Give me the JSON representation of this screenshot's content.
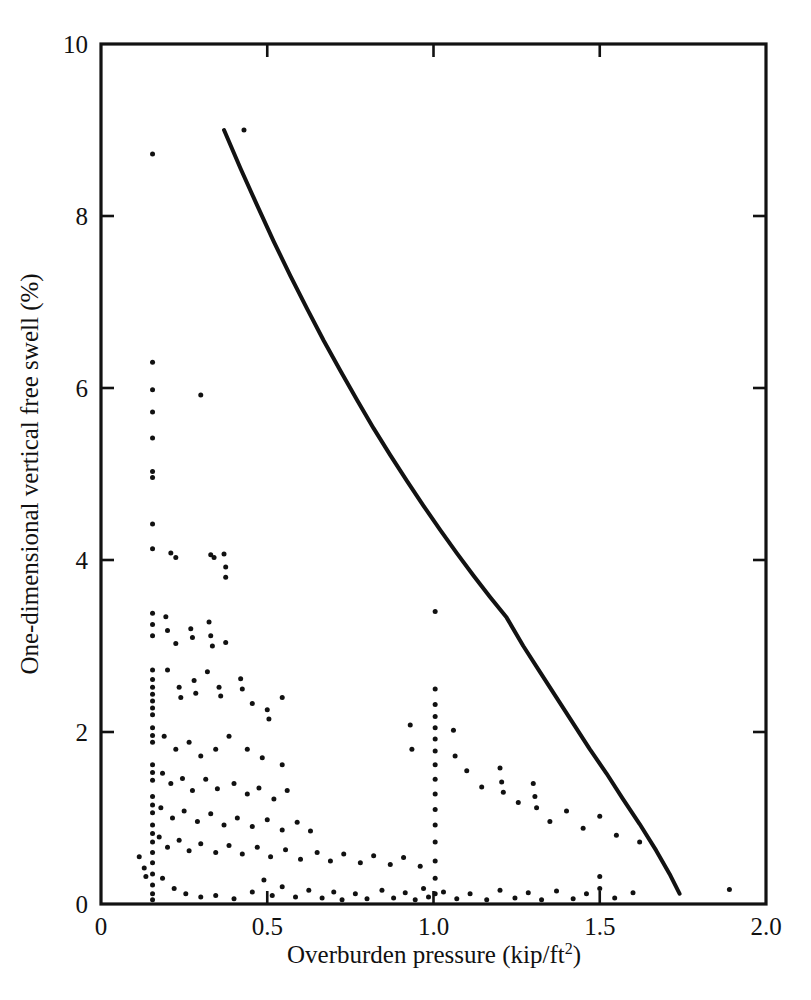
{
  "chart_data": {
    "type": "scatter",
    "title": "",
    "subtitle": "",
    "xlabel": "Overburden pressure (kip/ft",
    "xlabel_sup": "2",
    "xlabel_tail": ")",
    "xlabel_full": "Overburden pressure (kip/ft2)",
    "ylabel": "One-dimensional vertical free swell (%)",
    "xlim": [
      0,
      2.0
    ],
    "ylim": [
      0,
      10
    ],
    "xticks": [
      0,
      0.5,
      1.0,
      1.5,
      2.0
    ],
    "xtick_labels": [
      "0",
      "0.5",
      "1.0",
      "1.5",
      "2.0"
    ],
    "yticks": [
      0,
      2,
      4,
      6,
      8,
      10
    ],
    "ytick_labels": [
      "0",
      "2",
      "4",
      "6",
      "8",
      "10"
    ],
    "grid": false,
    "legend": null,
    "legend_position": "none",
    "frame": "box",
    "tick_direction": "in",
    "marker": "dot",
    "marker_color": "#111111",
    "curve_color": "#121212",
    "series": [
      {
        "name": "Upper-bound envelope curve",
        "type": "line",
        "points": [
          [
            0.37,
            9.0
          ],
          [
            0.42,
            8.55
          ],
          [
            0.47,
            8.12
          ],
          [
            0.52,
            7.7
          ],
          [
            0.57,
            7.3
          ],
          [
            0.62,
            6.92
          ],
          [
            0.67,
            6.55
          ],
          [
            0.72,
            6.2
          ],
          [
            0.77,
            5.86
          ],
          [
            0.82,
            5.53
          ],
          [
            0.87,
            5.22
          ],
          [
            0.92,
            4.92
          ],
          [
            0.97,
            4.63
          ],
          [
            1.02,
            4.35
          ],
          [
            1.07,
            4.08
          ],
          [
            1.12,
            3.82
          ],
          [
            1.17,
            3.57
          ],
          [
            1.22,
            3.33
          ],
          [
            1.27,
            3.0
          ],
          [
            1.32,
            2.7
          ],
          [
            1.37,
            2.4
          ],
          [
            1.42,
            2.1
          ],
          [
            1.47,
            1.8
          ],
          [
            1.52,
            1.52
          ],
          [
            1.57,
            1.22
          ],
          [
            1.62,
            0.93
          ],
          [
            1.67,
            0.62
          ],
          [
            1.71,
            0.35
          ],
          [
            1.74,
            0.12
          ]
        ]
      },
      {
        "name": "Measured free swell data",
        "type": "scatter",
        "points": [
          [
            0.155,
            8.72
          ],
          [
            0.43,
            9.0
          ],
          [
            0.155,
            6.3
          ],
          [
            0.155,
            5.98
          ],
          [
            0.155,
            5.72
          ],
          [
            0.155,
            5.42
          ],
          [
            0.155,
            5.03
          ],
          [
            0.155,
            4.96
          ],
          [
            0.3,
            5.92
          ],
          [
            0.155,
            4.42
          ],
          [
            0.155,
            4.13
          ],
          [
            0.21,
            4.08
          ],
          [
            0.225,
            4.03
          ],
          [
            0.33,
            4.06
          ],
          [
            0.34,
            4.03
          ],
          [
            0.37,
            4.07
          ],
          [
            0.375,
            3.92
          ],
          [
            0.375,
            3.8
          ],
          [
            0.155,
            3.38
          ],
          [
            0.155,
            3.25
          ],
          [
            0.155,
            3.12
          ],
          [
            0.195,
            3.34
          ],
          [
            0.2,
            3.18
          ],
          [
            0.225,
            3.03
          ],
          [
            0.27,
            3.2
          ],
          [
            0.275,
            3.1
          ],
          [
            0.325,
            3.28
          ],
          [
            0.33,
            3.12
          ],
          [
            0.335,
            3.0
          ],
          [
            0.375,
            3.04
          ],
          [
            1.005,
            3.4
          ],
          [
            0.155,
            2.72
          ],
          [
            0.155,
            2.61
          ],
          [
            0.155,
            2.52
          ],
          [
            0.155,
            2.44
          ],
          [
            0.155,
            2.36
          ],
          [
            0.155,
            2.28
          ],
          [
            0.155,
            2.2
          ],
          [
            0.2,
            2.72
          ],
          [
            0.235,
            2.52
          ],
          [
            0.24,
            2.4
          ],
          [
            0.28,
            2.6
          ],
          [
            0.285,
            2.45
          ],
          [
            0.32,
            2.7
          ],
          [
            0.355,
            2.52
          ],
          [
            0.36,
            2.42
          ],
          [
            0.42,
            2.62
          ],
          [
            0.425,
            2.5
          ],
          [
            0.455,
            2.33
          ],
          [
            0.5,
            2.26
          ],
          [
            0.505,
            2.15
          ],
          [
            0.545,
            2.4
          ],
          [
            0.155,
            2.05
          ],
          [
            0.155,
            1.96
          ],
          [
            0.155,
            1.88
          ],
          [
            0.19,
            1.95
          ],
          [
            0.225,
            1.8
          ],
          [
            0.265,
            1.88
          ],
          [
            0.3,
            1.72
          ],
          [
            0.345,
            1.8
          ],
          [
            0.385,
            1.95
          ],
          [
            0.44,
            1.8
          ],
          [
            0.485,
            1.7
          ],
          [
            0.545,
            1.62
          ],
          [
            0.155,
            1.62
          ],
          [
            0.155,
            1.53
          ],
          [
            0.155,
            1.44
          ],
          [
            0.185,
            1.52
          ],
          [
            0.21,
            1.4
          ],
          [
            0.245,
            1.46
          ],
          [
            0.275,
            1.32
          ],
          [
            0.315,
            1.45
          ],
          [
            0.35,
            1.34
          ],
          [
            0.4,
            1.4
          ],
          [
            0.44,
            1.28
          ],
          [
            0.475,
            1.35
          ],
          [
            0.52,
            1.22
          ],
          [
            0.56,
            1.32
          ],
          [
            0.155,
            1.25
          ],
          [
            0.155,
            1.15
          ],
          [
            0.155,
            1.06
          ],
          [
            0.18,
            1.12
          ],
          [
            0.215,
            1.0
          ],
          [
            0.25,
            1.08
          ],
          [
            0.29,
            0.96
          ],
          [
            0.33,
            1.05
          ],
          [
            0.37,
            0.92
          ],
          [
            0.41,
            1.0
          ],
          [
            0.455,
            0.9
          ],
          [
            0.5,
            0.98
          ],
          [
            0.545,
            0.86
          ],
          [
            0.59,
            0.95
          ],
          [
            0.63,
            0.85
          ],
          [
            0.155,
            0.92
          ],
          [
            0.155,
            0.82
          ],
          [
            0.155,
            0.72
          ],
          [
            0.175,
            0.78
          ],
          [
            0.2,
            0.66
          ],
          [
            0.235,
            0.74
          ],
          [
            0.265,
            0.62
          ],
          [
            0.3,
            0.7
          ],
          [
            0.345,
            0.6
          ],
          [
            0.385,
            0.68
          ],
          [
            0.425,
            0.58
          ],
          [
            0.47,
            0.66
          ],
          [
            0.51,
            0.55
          ],
          [
            0.555,
            0.63
          ],
          [
            0.6,
            0.52
          ],
          [
            0.65,
            0.6
          ],
          [
            0.69,
            0.5
          ],
          [
            0.73,
            0.58
          ],
          [
            0.78,
            0.48
          ],
          [
            0.82,
            0.56
          ],
          [
            0.87,
            0.46
          ],
          [
            0.91,
            0.54
          ],
          [
            0.96,
            0.44
          ],
          [
            1.005,
            2.5
          ],
          [
            1.005,
            2.32
          ],
          [
            1.005,
            2.18
          ],
          [
            1.005,
            2.05
          ],
          [
            1.005,
            1.92
          ],
          [
            1.005,
            1.78
          ],
          [
            1.005,
            1.62
          ],
          [
            1.005,
            1.45
          ],
          [
            1.005,
            1.28
          ],
          [
            1.005,
            1.1
          ],
          [
            1.005,
            0.92
          ],
          [
            1.005,
            0.72
          ],
          [
            1.005,
            0.5
          ],
          [
            1.005,
            0.3
          ],
          [
            1.005,
            0.12
          ],
          [
            0.93,
            2.08
          ],
          [
            0.935,
            1.8
          ],
          [
            1.06,
            2.02
          ],
          [
            1.065,
            1.72
          ],
          [
            1.1,
            1.55
          ],
          [
            1.145,
            1.36
          ],
          [
            1.2,
            1.58
          ],
          [
            1.205,
            1.42
          ],
          [
            1.21,
            1.3
          ],
          [
            1.255,
            1.18
          ],
          [
            1.3,
            1.4
          ],
          [
            1.305,
            1.25
          ],
          [
            1.31,
            1.12
          ],
          [
            1.35,
            0.96
          ],
          [
            1.4,
            1.08
          ],
          [
            1.45,
            0.88
          ],
          [
            1.5,
            1.02
          ],
          [
            1.55,
            0.8
          ],
          [
            1.62,
            0.72
          ],
          [
            0.115,
            0.55
          ],
          [
            0.13,
            0.42
          ],
          [
            0.135,
            0.32
          ],
          [
            0.155,
            0.6
          ],
          [
            0.155,
            0.48
          ],
          [
            0.155,
            0.35
          ],
          [
            0.155,
            0.22
          ],
          [
            0.155,
            0.12
          ],
          [
            0.155,
            0.05
          ],
          [
            0.185,
            0.3
          ],
          [
            0.22,
            0.18
          ],
          [
            0.255,
            0.12
          ],
          [
            0.3,
            0.08
          ],
          [
            0.345,
            0.1
          ],
          [
            0.4,
            0.06
          ],
          [
            0.455,
            0.14
          ],
          [
            0.49,
            0.28
          ],
          [
            0.515,
            0.1
          ],
          [
            0.545,
            0.2
          ],
          [
            0.585,
            0.08
          ],
          [
            0.625,
            0.16
          ],
          [
            0.665,
            0.07
          ],
          [
            0.7,
            0.14
          ],
          [
            0.725,
            0.05
          ],
          [
            0.765,
            0.12
          ],
          [
            0.8,
            0.06
          ],
          [
            0.845,
            0.16
          ],
          [
            0.88,
            0.07
          ],
          [
            0.915,
            0.13
          ],
          [
            0.945,
            0.05
          ],
          [
            0.97,
            0.18
          ],
          [
            0.985,
            0.08
          ],
          [
            1.03,
            0.14
          ],
          [
            1.07,
            0.06
          ],
          [
            1.11,
            0.12
          ],
          [
            1.16,
            0.05
          ],
          [
            1.2,
            0.16
          ],
          [
            1.245,
            0.07
          ],
          [
            1.285,
            0.13
          ],
          [
            1.325,
            0.05
          ],
          [
            1.37,
            0.15
          ],
          [
            1.42,
            0.06
          ],
          [
            1.46,
            0.12
          ],
          [
            1.5,
            0.32
          ],
          [
            1.5,
            0.18
          ],
          [
            1.545,
            0.07
          ],
          [
            1.6,
            0.13
          ],
          [
            1.89,
            0.17
          ]
        ]
      }
    ]
  },
  "geometry": {
    "plot_left": 101,
    "plot_right": 766,
    "plot_top": 44,
    "plot_bottom": 904
  }
}
